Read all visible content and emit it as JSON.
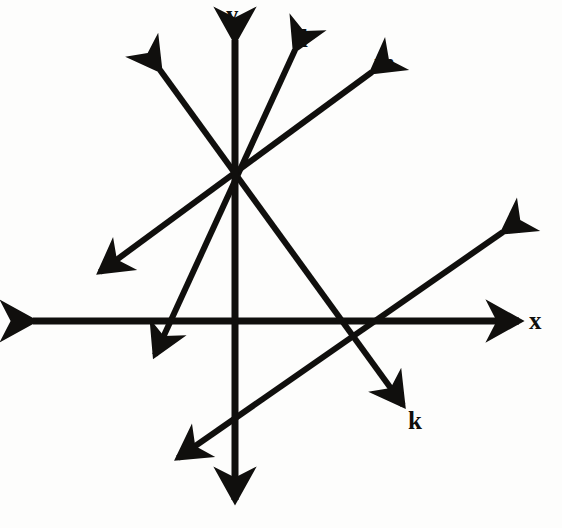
{
  "figure": {
    "kind": "geometry-diagram",
    "background_color": "#fdfdfc",
    "stroke_color": "#100f0d",
    "axis_stroke_width": 7,
    "line_stroke_width": 6
  },
  "chart_data": {
    "type": "scatter",
    "title": "",
    "xlabel": "x",
    "ylabel": "y",
    "grid": false,
    "legend": "none",
    "origin_px": {
      "x": 235,
      "y": 321
    },
    "concurrency_point_px": {
      "x": 235,
      "y": 177
    },
    "axes": [
      {
        "name": "x",
        "label": "x",
        "from_px": {
          "x": 33,
          "y": 321
        },
        "to_px": {
          "x": 519,
          "y": 321
        },
        "double_arrow": true
      },
      {
        "name": "y",
        "label": "y",
        "from_px": {
          "x": 235,
          "y": 40
        },
        "to_px": {
          "x": 235,
          "y": 500
        },
        "double_arrow": true
      }
    ],
    "lines": [
      {
        "name": "k",
        "label": "k",
        "from_px": {
          "x": 160,
          "y": 70
        },
        "to_px": {
          "x": 403,
          "y": 405
        },
        "double_arrow": true,
        "passes_through_concurrency": true
      },
      {
        "name": "l",
        "label": "l",
        "from_px": {
          "x": 295,
          "y": 50
        },
        "to_px": {
          "x": 155,
          "y": 355
        },
        "double_arrow": true,
        "passes_through_concurrency": true
      },
      {
        "name": "m",
        "label": "m",
        "from_px": {
          "x": 372,
          "y": 72
        },
        "to_px": {
          "x": 100,
          "y": 272
        },
        "double_arrow": true,
        "passes_through_concurrency": true
      },
      {
        "name": "n",
        "label": "n",
        "from_px": {
          "x": 503,
          "y": 232
        },
        "to_px": {
          "x": 178,
          "y": 458
        },
        "double_arrow": true,
        "passes_through_concurrency": false
      }
    ]
  },
  "labels": {
    "y": {
      "text": "y",
      "x": 226,
      "y": 2
    },
    "l": {
      "text": "l",
      "x": 301,
      "y": 26
    },
    "m": {
      "text": "m",
      "x": 374,
      "y": 50
    },
    "n": {
      "text": "n",
      "x": 506,
      "y": 212
    },
    "x": {
      "text": "x",
      "x": 529,
      "y": 308
    },
    "k": {
      "text": "k",
      "x": 408,
      "y": 408
    }
  }
}
